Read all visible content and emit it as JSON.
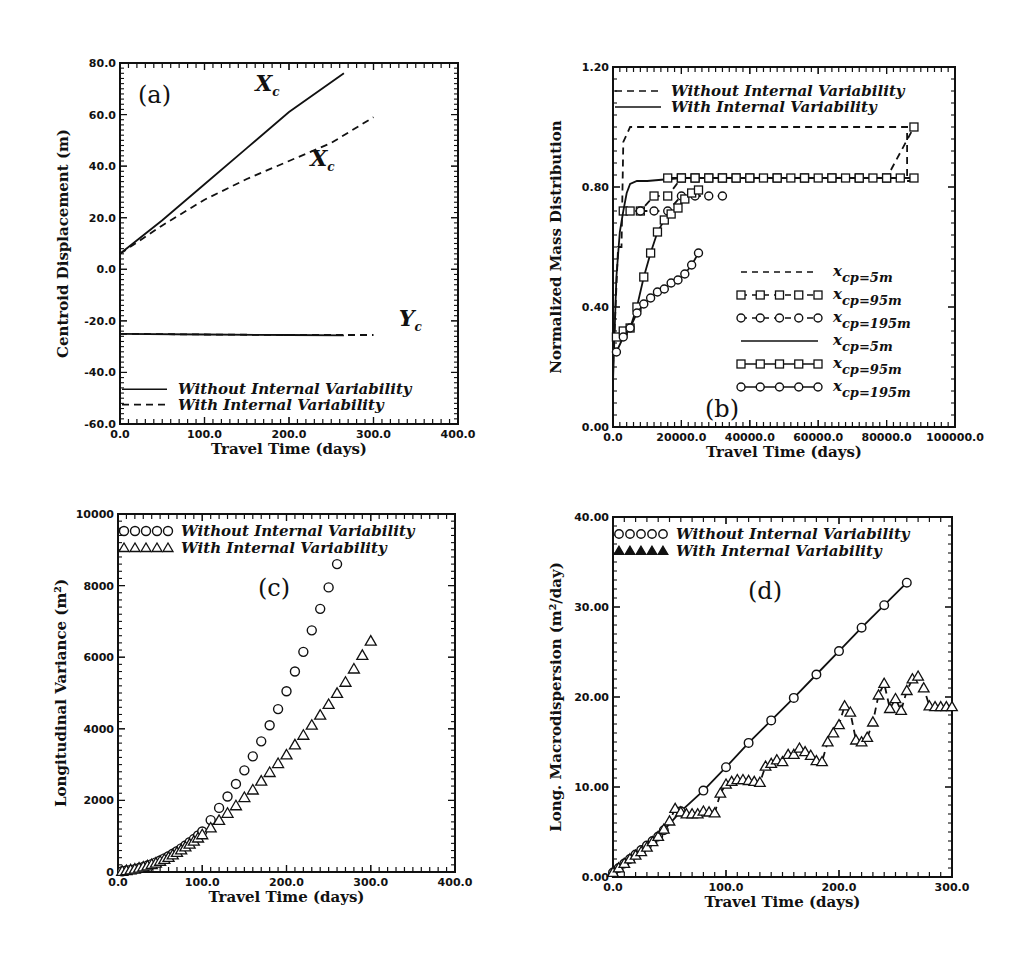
{
  "chart_data": [
    {
      "id": "a",
      "type": "line",
      "panel_label": "(a)",
      "title": "",
      "xlabel": "Travel Time (days)",
      "ylabel": "Centroid Displacement (m)",
      "xlim": [
        0,
        400
      ],
      "ylim": [
        -60,
        80
      ],
      "xticks": [
        0,
        100,
        200,
        300,
        400
      ],
      "xtick_labels": [
        "0.0",
        "100.0",
        "200.0",
        "300.0",
        "400.0"
      ],
      "yticks": [
        -60,
        -40,
        -20,
        0,
        20,
        40,
        60,
        80
      ],
      "ytick_labels": [
        "-60.0",
        "-40.0",
        "-20.0",
        "0.0",
        "20.0",
        "40.0",
        "60.0",
        "80.0"
      ],
      "legend": [
        {
          "label": "Without Internal Variability",
          "style": "solid"
        },
        {
          "label": "With Internal Variability",
          "style": "dashed"
        }
      ],
      "annotations": [
        {
          "text": "X",
          "sub": "c",
          "x": 160,
          "y": 69
        },
        {
          "text": "X",
          "sub": "c",
          "x": 225,
          "y": 40
        },
        {
          "text": "Y",
          "sub": "c",
          "x": 330,
          "y": -22
        }
      ],
      "series": [
        {
          "name": "Xc Without Internal Variability",
          "style": "solid",
          "x": [
            0,
            50,
            100,
            150,
            200,
            265
          ],
          "y": [
            6,
            19,
            33,
            47,
            61,
            76
          ]
        },
        {
          "name": "Xc With Internal Variability",
          "style": "dashed",
          "x": [
            0,
            50,
            100,
            150,
            200,
            250,
            300
          ],
          "y": [
            6,
            17,
            27,
            35,
            42,
            49,
            59
          ]
        },
        {
          "name": "Yc Without Internal Variability",
          "style": "solid",
          "x": [
            0,
            100,
            200,
            265
          ],
          "y": [
            -25,
            -25.3,
            -25.5,
            -25.6
          ]
        },
        {
          "name": "Yc With Internal Variability",
          "style": "dashed",
          "x": [
            0,
            100,
            200,
            300
          ],
          "y": [
            -25,
            -25.3,
            -25.5,
            -25.5
          ]
        }
      ]
    },
    {
      "id": "b",
      "type": "line",
      "panel_label": "(b)",
      "title": "",
      "xlabel": "Travel Time (days)",
      "ylabel": "Normalized Mass Distribution",
      "xlim": [
        0,
        100000
      ],
      "ylim": [
        0,
        1.2
      ],
      "xticks": [
        0,
        20000,
        40000,
        60000,
        80000,
        100000
      ],
      "xtick_labels": [
        "0.0",
        "20000.0",
        "40000.0",
        "60000.0",
        "80000.0",
        "100000.0"
      ],
      "yticks": [
        0,
        0.4,
        0.8,
        1.2
      ],
      "ytick_labels": [
        "0.00",
        "0.40",
        "0.80",
        "1.20"
      ],
      "legend_top": [
        {
          "label": "Without Internal Variability",
          "style": "dashed"
        },
        {
          "label": "With Internal Variability",
          "style": "solid"
        }
      ],
      "legend": [
        {
          "label": "x_cp=5m",
          "style": "dashed"
        },
        {
          "label": "x_cp=95m",
          "style": "dashed-square"
        },
        {
          "label": "x_cp=195m",
          "style": "dashed-circle"
        },
        {
          "label": "x_cp=5m",
          "style": "solid"
        },
        {
          "label": "x_cp=95m",
          "style": "solid-square"
        },
        {
          "label": "x_cp=195m",
          "style": "solid-circle"
        }
      ],
      "series": [
        {
          "name": "Without x_cp=5m",
          "style": "dashed",
          "marker": "none",
          "x": [
            0,
            1500,
            2500,
            3000,
            5000,
            86000,
            86000,
            88000
          ],
          "y": [
            0.2,
            0.6,
            0.6,
            0.95,
            1.0,
            1.0,
            0.82,
            0.82
          ]
        },
        {
          "name": "Without x_cp=95m",
          "style": "dashed",
          "marker": "square",
          "x": [
            3000,
            5000,
            8000,
            12000,
            16000,
            20000,
            24000,
            28000,
            32000,
            36000,
            40000,
            48000,
            56000,
            64000,
            72000,
            80000,
            88000
          ],
          "y": [
            0.72,
            0.72,
            0.72,
            0.77,
            0.77,
            0.83,
            0.83,
            0.83,
            0.83,
            0.83,
            0.83,
            0.83,
            0.83,
            0.83,
            0.83,
            0.83,
            1.0
          ]
        },
        {
          "name": "Without x_cp=195m",
          "style": "dashed",
          "marker": "circle",
          "x": [
            8000,
            12000,
            16000,
            20000,
            24000,
            28000,
            32000
          ],
          "y": [
            0.72,
            0.72,
            0.72,
            0.77,
            0.77,
            0.77,
            0.77
          ]
        },
        {
          "name": "With x_cp=5m",
          "style": "solid",
          "marker": "none",
          "x": [
            0,
            1000,
            2000,
            3000,
            4000,
            5000,
            7000,
            10000,
            20000,
            88000
          ],
          "y": [
            0.15,
            0.5,
            0.65,
            0.72,
            0.78,
            0.81,
            0.82,
            0.82,
            0.83,
            0.83
          ]
        },
        {
          "name": "With x_cp=95m",
          "style": "solid",
          "marker": "square",
          "x": [
            1000,
            3000,
            5000,
            7000,
            9000,
            11000,
            13000,
            15000,
            17000,
            19000,
            21000,
            23000,
            25000
          ],
          "y": [
            0.3,
            0.32,
            0.33,
            0.4,
            0.5,
            0.58,
            0.65,
            0.69,
            0.71,
            0.73,
            0.76,
            0.78,
            0.79
          ]
        },
        {
          "name": "With x_cp=195m",
          "style": "solid",
          "marker": "circle",
          "x": [
            1000,
            3000,
            5000,
            7000,
            9000,
            11000,
            13000,
            15000,
            17000,
            19000,
            21000,
            23000,
            25000
          ],
          "y": [
            0.25,
            0.3,
            0.33,
            0.38,
            0.41,
            0.43,
            0.45,
            0.46,
            0.48,
            0.49,
            0.51,
            0.54,
            0.58
          ]
        },
        {
          "name": "With x_cp=5m flat",
          "style": "solid",
          "marker": "square",
          "x": [
            16000,
            20000,
            24000,
            28000,
            32000,
            36000,
            40000,
            44000,
            48000,
            52000,
            56000,
            60000,
            64000,
            68000,
            72000,
            76000,
            80000,
            84000,
            88000
          ],
          "y": [
            0.83,
            0.83,
            0.83,
            0.83,
            0.83,
            0.83,
            0.83,
            0.83,
            0.83,
            0.83,
            0.83,
            0.83,
            0.83,
            0.83,
            0.83,
            0.83,
            0.83,
            0.83,
            0.83
          ]
        }
      ]
    },
    {
      "id": "c",
      "type": "scatter",
      "panel_label": "(c)",
      "title": "",
      "xlabel": "Travel Time (days)",
      "ylabel": "Longitudinal Variance (m²)",
      "xlim": [
        0,
        400
      ],
      "ylim": [
        0,
        10000
      ],
      "xticks": [
        0,
        100,
        200,
        300,
        400
      ],
      "xtick_labels": [
        "0.0",
        "100.0",
        "200.0",
        "300.0",
        "400.0"
      ],
      "yticks": [
        0,
        2000,
        4000,
        6000,
        8000,
        10000
      ],
      "ytick_labels": [
        "0",
        "2000",
        "4000",
        "6000",
        "8000",
        "10000"
      ],
      "legend": [
        {
          "label": "Without Internal Variability",
          "marker": "circle"
        },
        {
          "label": "With Internal Variability",
          "marker": "triangle"
        }
      ],
      "series": [
        {
          "name": "Without Internal Variability",
          "marker": "circle",
          "x": [
            5,
            10,
            15,
            20,
            25,
            30,
            35,
            40,
            45,
            50,
            55,
            60,
            65,
            70,
            75,
            80,
            85,
            90,
            95,
            100,
            110,
            120,
            130,
            140,
            150,
            160,
            170,
            180,
            190,
            200,
            210,
            220,
            230,
            240,
            250,
            260
          ],
          "y": [
            20,
            40,
            60,
            80,
            110,
            140,
            180,
            220,
            270,
            320,
            380,
            440,
            510,
            580,
            660,
            740,
            830,
            920,
            1020,
            1130,
            1450,
            1790,
            2110,
            2460,
            2840,
            3230,
            3650,
            4100,
            4550,
            5050,
            5600,
            6150,
            6750,
            7350,
            7950,
            8600
          ]
        },
        {
          "name": "With Internal Variability",
          "marker": "triangle",
          "x": [
            5,
            10,
            15,
            20,
            25,
            30,
            35,
            40,
            45,
            50,
            55,
            60,
            65,
            70,
            75,
            80,
            85,
            90,
            95,
            100,
            110,
            120,
            130,
            140,
            150,
            160,
            170,
            180,
            190,
            200,
            210,
            220,
            230,
            240,
            250,
            260,
            270,
            280,
            290,
            300
          ],
          "y": [
            20,
            40,
            60,
            80,
            110,
            140,
            170,
            210,
            250,
            300,
            350,
            410,
            480,
            550,
            620,
            700,
            780,
            860,
            950,
            1040,
            1230,
            1440,
            1640,
            1850,
            2080,
            2290,
            2540,
            2780,
            3030,
            3270,
            3550,
            3820,
            4100,
            4380,
            4680,
            4990,
            5300,
            5670,
            6050,
            6450
          ]
        }
      ]
    },
    {
      "id": "d",
      "type": "line",
      "panel_label": "(d)",
      "title": "",
      "xlabel": "Travel Time (days)",
      "ylabel": "Long. Macrodispersion (m²/day)",
      "xlim": [
        0,
        300
      ],
      "ylim": [
        0,
        40
      ],
      "xticks": [
        0,
        100,
        200,
        300
      ],
      "xtick_labels": [
        "0.0",
        "100.0",
        "200.0",
        "300.0"
      ],
      "yticks": [
        0,
        10,
        20,
        30,
        40
      ],
      "ytick_labels": [
        "0.00",
        "10.00",
        "20.00",
        "30.00",
        "40.00"
      ],
      "legend": [
        {
          "label": "Without Internal Variability",
          "marker": "circle"
        },
        {
          "label": "With Internal Variability",
          "marker": "triangle"
        }
      ],
      "series": [
        {
          "name": "Without Internal Variability",
          "style": "solid",
          "marker": "circle",
          "x": [
            0,
            5,
            10,
            15,
            20,
            25,
            30,
            35,
            40,
            45,
            60,
            80,
            100,
            120,
            140,
            160,
            180,
            200,
            220,
            240,
            260
          ],
          "y": [
            0.5,
            1.0,
            1.5,
            2.0,
            2.5,
            3.0,
            3.5,
            4.0,
            4.5,
            5.2,
            7.3,
            9.6,
            12.2,
            14.9,
            17.4,
            19.9,
            22.5,
            25.1,
            27.7,
            30.2,
            32.7
          ]
        },
        {
          "name": "With Internal Variability",
          "style": "dashed",
          "marker": "triangle",
          "x": [
            0,
            5,
            10,
            15,
            20,
            25,
            30,
            35,
            40,
            45,
            50,
            55,
            60,
            65,
            70,
            75,
            80,
            85,
            90,
            95,
            100,
            105,
            110,
            115,
            120,
            125,
            130,
            135,
            140,
            145,
            150,
            155,
            160,
            165,
            170,
            175,
            180,
            185,
            190,
            195,
            200,
            205,
            210,
            215,
            220,
            225,
            230,
            235,
            240,
            245,
            250,
            255,
            260,
            265,
            270,
            275,
            280,
            285,
            290,
            295,
            300
          ],
          "y": [
            0.5,
            1.0,
            1.5,
            2.0,
            2.4,
            2.8,
            3.3,
            3.9,
            4.5,
            5.3,
            6.2,
            7.6,
            7.2,
            7.0,
            7.0,
            7.0,
            7.3,
            7.2,
            7.1,
            9.3,
            10.3,
            10.6,
            10.8,
            10.8,
            10.7,
            10.6,
            10.5,
            12.3,
            12.6,
            13.0,
            12.8,
            13.6,
            13.6,
            14.3,
            13.9,
            13.5,
            12.9,
            12.8,
            15.0,
            16.0,
            16.9,
            19.0,
            18.3,
            15.2,
            15.0,
            15.5,
            17.2,
            20.2,
            21.5,
            18.7,
            19.8,
            18.5,
            20.7,
            22.0,
            22.3,
            21.0,
            19.0,
            18.9,
            18.9,
            18.9,
            18.9
          ]
        }
      ]
    }
  ],
  "panels": {
    "a": {
      "legend_1": "Without Internal Variability",
      "legend_2": "With Internal Variability",
      "label": "(a)"
    },
    "b": {
      "legend_top_1": "Without Internal Variability",
      "legend_top_2": "With Internal Variability",
      "label": "(b)"
    },
    "c": {
      "legend_1": "Without Internal Variability",
      "legend_2": "With Internal Variability",
      "label": "(c)"
    },
    "d": {
      "legend_1": "Without Internal Variability",
      "legend_2": "With Internal Variability",
      "label": "(d)"
    }
  }
}
